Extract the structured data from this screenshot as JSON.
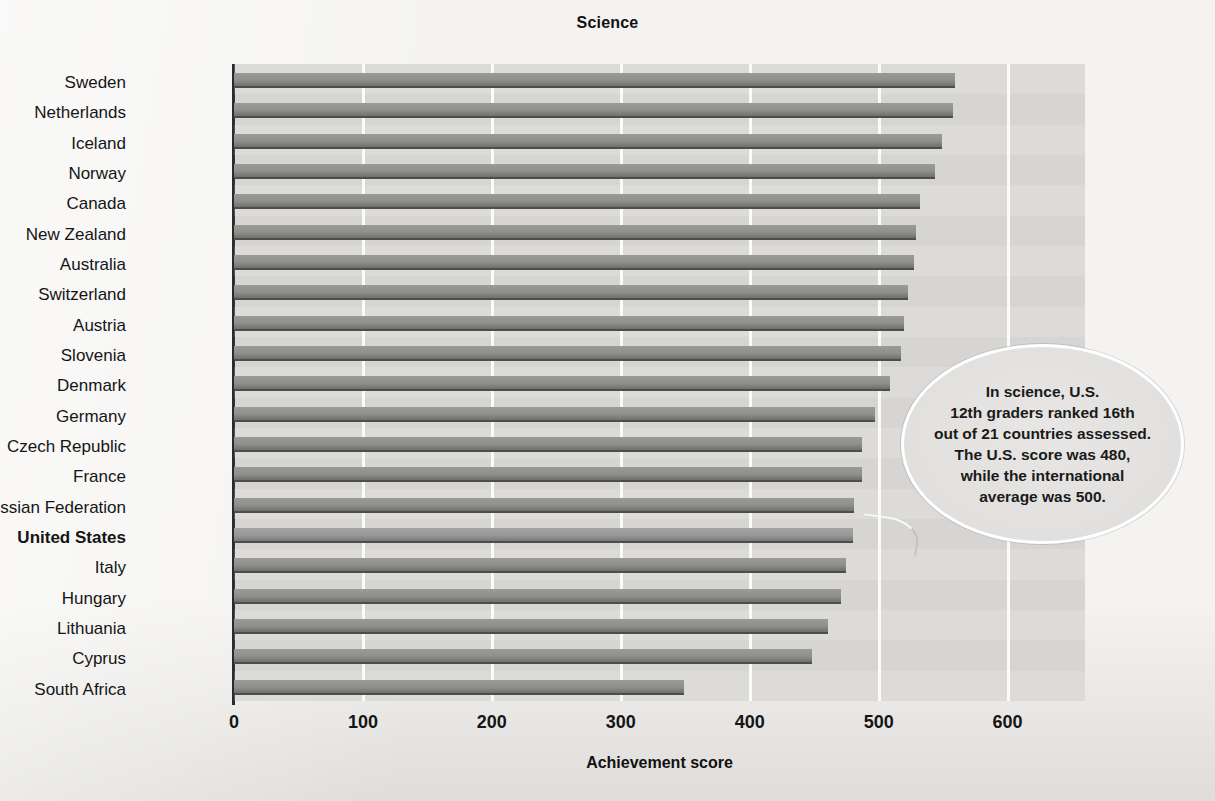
{
  "chart_data": {
    "type": "bar",
    "orientation": "horizontal",
    "title": "Science",
    "xlabel": "Achievement score",
    "ylabel": "",
    "xlim": [
      0,
      660
    ],
    "xticks": [
      0,
      100,
      200,
      300,
      400,
      500,
      600
    ],
    "xtick_labels": [
      "0",
      "100",
      "200",
      "300",
      "400",
      "500",
      "600"
    ],
    "grid": "vertical",
    "legend": "none",
    "highlight_category": "United States",
    "categories": [
      "Sweden",
      "Netherlands",
      "Iceland",
      "Norway",
      "Canada",
      "New Zealand",
      "Australia",
      "Switzerland",
      "Austria",
      "Slovenia",
      "Denmark",
      "Germany",
      "Czech Republic",
      "France",
      "Russian Federation",
      "United States",
      "Italy",
      "Hungary",
      "Lithuania",
      "Cyprus",
      "South Africa"
    ],
    "values": [
      559,
      558,
      549,
      544,
      532,
      529,
      527,
      523,
      520,
      517,
      509,
      497,
      487,
      487,
      481,
      480,
      475,
      471,
      461,
      448,
      349
    ],
    "annotations": [
      {
        "name": "us-callout",
        "text": "In science, U.S. 12th graders ranked 16th out of 21 countries assessed. The U.S. score was 480, while the international average was 500.",
        "lines": [
          "In science, U.S.",
          "12th graders ranked 16th",
          "out of 21 countries assessed.",
          "The U.S. score was 480,",
          "while the international",
          "average was 500."
        ],
        "target": "United States"
      }
    ],
    "colors": {
      "bar": "#8f8f8d",
      "bar_edge": "#4d4d4b",
      "plot_background": "#d4d3d1",
      "gridline": "#fbfbfa",
      "page_background": "#f4f3f1",
      "text": "#151515"
    }
  }
}
